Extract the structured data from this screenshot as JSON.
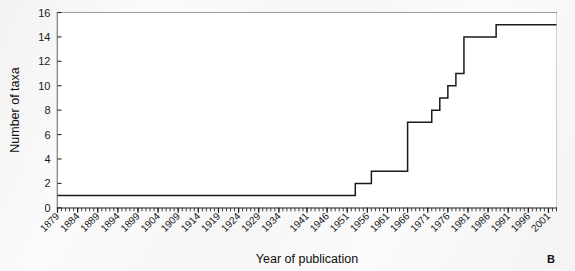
{
  "figure": {
    "panel_label": "B",
    "background_color": "#f7f7f7",
    "line_color": "#1a1a1a",
    "axis_color": "#3a3a3a"
  },
  "chart_data": {
    "type": "line",
    "subtype": "step-cumulative",
    "title": "",
    "xlabel": "Year of publication",
    "ylabel": "Number of taxa",
    "xlim": [
      1879,
      2003
    ],
    "ylim": [
      0,
      16
    ],
    "grid": false,
    "legend": null,
    "yticks": [
      0,
      2,
      4,
      6,
      8,
      10,
      12,
      14,
      16
    ],
    "ytick_labels": [
      "0",
      "2",
      "4",
      "6",
      "8",
      "10",
      "12",
      "14",
      "16"
    ],
    "xticks": [
      1879,
      1884,
      1889,
      1894,
      1899,
      1904,
      1909,
      1914,
      1919,
      1924,
      1929,
      1934,
      1941,
      1946,
      1951,
      1956,
      1961,
      1966,
      1971,
      1976,
      1981,
      1986,
      1991,
      1996,
      2001
    ],
    "xtick_labels": [
      "1879",
      "1884",
      "1889",
      "1894",
      "1899",
      "1904",
      "1909",
      "1914",
      "1919",
      "1924",
      "1929",
      "1934",
      "1941",
      "1946",
      "1951",
      "1956",
      "1961",
      "1966",
      "1971",
      "1976",
      "1981",
      "1986",
      "1991",
      "1996",
      "2001"
    ],
    "minor_xtick_interval": 1,
    "series": [
      {
        "name": "Cumulative number of taxa",
        "x": [
          1879,
          1952,
          1953,
          1956,
          1957,
          1959,
          1960,
          1965,
          1966,
          1971,
          1972,
          1973,
          1974,
          1975,
          1976,
          1977,
          1978,
          1979,
          1980,
          1981,
          1987,
          1988,
          2003
        ],
        "values": [
          1,
          1,
          2,
          2,
          3,
          3,
          3,
          3,
          7,
          7,
          8,
          8,
          9,
          9,
          10,
          10,
          11,
          11,
          14,
          14,
          14,
          15,
          15
        ]
      }
    ],
    "annotations": []
  }
}
